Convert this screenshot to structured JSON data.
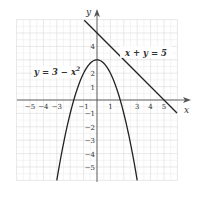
{
  "chart_data": {
    "type": "line",
    "title": "",
    "xlabel": "x",
    "ylabel": "y",
    "xlim": [
      -6,
      6
    ],
    "ylim": [
      -6,
      6
    ],
    "grid": true,
    "x_tick_labels": [
      "-5",
      "-4",
      "-3",
      "-1",
      "1",
      "3",
      "4",
      "5"
    ],
    "y_tick_labels": [
      "4",
      "2",
      "1",
      "-1",
      "-2",
      "-3",
      "-4",
      "-5"
    ],
    "series": [
      {
        "name": "y = 3 − x²",
        "equation": "y = 3 - x^2",
        "kind": "parabola",
        "vertex": [
          0,
          3
        ],
        "x_range": [
          -3,
          3
        ]
      },
      {
        "name": "x + y = 5",
        "equation": "x + y = 5",
        "kind": "line",
        "points": [
          [
            -1,
            6
          ],
          [
            6,
            -1
          ]
        ]
      }
    ],
    "annotations": [
      {
        "text": "y = 3 − x²",
        "near": [
          -2.3,
          2
        ]
      },
      {
        "text": "x + y = 5",
        "near": [
          3.3,
          3.4
        ]
      }
    ]
  },
  "labels": {
    "x_axis": "x",
    "y_axis": "y",
    "parabola": "y = 3 − x",
    "parabola_sup": "2",
    "line": "x + y = 5",
    "xt": [
      "−5",
      "−4",
      "−3",
      "−1",
      "1",
      "3",
      "4",
      "5"
    ],
    "yt": [
      "4",
      "2",
      "1",
      "−1",
      "−2",
      "−3",
      "−4",
      "−5"
    ]
  }
}
